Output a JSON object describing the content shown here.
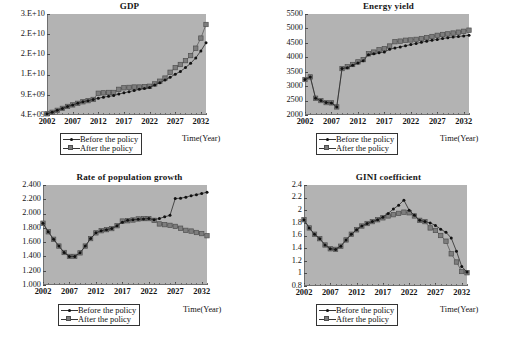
{
  "figure": {
    "background": "#ffffff",
    "plot_background": "#b3b3b3",
    "series_colors": {
      "before": "#2b2b2b",
      "after": "#6e6e6e"
    }
  },
  "legend": {
    "before_label": "Before the policy",
    "after_label": "After the policy",
    "before_marker": "dot-marker-icon",
    "after_marker": "square-marker-icon"
  },
  "axis": {
    "x_title": "Time(Year)",
    "x_ticks": [
      "2002",
      "2007",
      "2012",
      "2017",
      "2022",
      "2027",
      "2032"
    ]
  },
  "chart_data": [
    {
      "type": "line",
      "title": "GDP",
      "xlabel": "Time(Year)",
      "ylabel": "",
      "x": [
        2002,
        2003,
        2004,
        2005,
        2006,
        2007,
        2008,
        2009,
        2010,
        2011,
        2012,
        2013,
        2014,
        2015,
        2016,
        2017,
        2018,
        2019,
        2020,
        2021,
        2022,
        2023,
        2024,
        2025,
        2026,
        2027,
        2028,
        2029,
        2030,
        2031,
        2032,
        2033
      ],
      "ytick_labels": [
        "3.E+10",
        "2.E+10",
        "2.E+10",
        "1.E+10",
        "9.E+09",
        "4.E+09"
      ],
      "ylim": [
        4000000000.0,
        30000000000.0
      ],
      "grid": false,
      "legend_position": "below-left",
      "series": [
        {
          "name": "Before the policy",
          "values": [
            4300000000.0,
            4700000000.0,
            5200000000.0,
            5700000000.0,
            6200000000.0,
            6600000000.0,
            7000000000.0,
            7400000000.0,
            7700000000.0,
            8000000000.0,
            8300000000.0,
            8600000000.0,
            8800000000.0,
            9000000000.0,
            9400000000.0,
            9700000000.0,
            10000000000.0,
            10300000000.0,
            10600000000.0,
            10800000000.0,
            11100000000.0,
            11700000000.0,
            12300000000.0,
            13000000000.0,
            13700000000.0,
            14500000000.0,
            15200000000.0,
            16200000000.0,
            17300000000.0,
            18700000000.0,
            20500000000.0,
            22600000000.0
          ]
        },
        {
          "name": "After the policy",
          "values": [
            4300000000.0,
            4700000000.0,
            5200000000.0,
            5700000000.0,
            6200000000.0,
            6600000000.0,
            7000000000.0,
            7400000000.0,
            7700000000.0,
            8000000000.0,
            9600000000.0,
            9700000000.0,
            9800000000.0,
            9800000000.0,
            10600000000.0,
            11000000000.0,
            11100000000.0,
            11200000000.0,
            11200000000.0,
            11300000000.0,
            11400000000.0,
            12000000000.0,
            12700000000.0,
            13500000000.0,
            15000000000.0,
            16200000000.0,
            17000000000.0,
            18000000000.0,
            19300000000.0,
            21200000000.0,
            23800000000.0,
            27300000000.0
          ]
        }
      ]
    },
    {
      "type": "line",
      "title": "Energy yield",
      "xlabel": "Time(Year)",
      "ylabel": "",
      "x": [
        2002,
        2003,
        2004,
        2005,
        2006,
        2007,
        2008,
        2009,
        2010,
        2011,
        2012,
        2013,
        2014,
        2015,
        2016,
        2017,
        2018,
        2019,
        2020,
        2021,
        2022,
        2023,
        2024,
        2025,
        2026,
        2027,
        2028,
        2029,
        2030,
        2031,
        2032,
        2033
      ],
      "ytick_labels": [
        "5500",
        "5000",
        "4500",
        "4000",
        "3500",
        "3000",
        "2500",
        "2000"
      ],
      "ylim": [
        2000,
        5500
      ],
      "grid": false,
      "legend_position": "below-left",
      "series": [
        {
          "name": "Before the policy",
          "values": [
            3230,
            3320,
            2580,
            2500,
            2430,
            2420,
            2280,
            3610,
            3640,
            3720,
            3800,
            3880,
            4090,
            4120,
            4160,
            4180,
            4280,
            4320,
            4360,
            4400,
            4440,
            4480,
            4520,
            4560,
            4590,
            4620,
            4650,
            4680,
            4700,
            4720,
            4740,
            4760
          ]
        },
        {
          "name": "After the policy",
          "values": [
            3230,
            3320,
            2580,
            2500,
            2430,
            2420,
            2280,
            3610,
            3670,
            3750,
            3840,
            3920,
            4120,
            4180,
            4260,
            4300,
            4390,
            4540,
            4560,
            4590,
            4600,
            4620,
            4650,
            4680,
            4720,
            4760,
            4790,
            4810,
            4840,
            4870,
            4900,
            4940
          ]
        }
      ]
    },
    {
      "type": "line",
      "title": "Rate of population growth",
      "xlabel": "Time(Year)",
      "ylabel": "",
      "x": [
        2002,
        2003,
        2004,
        2005,
        2006,
        2007,
        2008,
        2009,
        2010,
        2011,
        2012,
        2013,
        2014,
        2015,
        2016,
        2017,
        2018,
        2019,
        2020,
        2021,
        2022,
        2023,
        2024,
        2025,
        2026,
        2027,
        2028,
        2029,
        2030,
        2031,
        2032,
        2033
      ],
      "ytick_labels": [
        "2.400",
        "2.200",
        "2.000",
        "1.800",
        "1.600",
        "1.400",
        "1.200",
        "1.000"
      ],
      "ylim": [
        1.0,
        2.4
      ],
      "grid": false,
      "legend_position": "below-left",
      "series": [
        {
          "name": "Before the policy",
          "values": [
            1.865,
            1.745,
            1.64,
            1.545,
            1.455,
            1.4,
            1.4,
            1.45,
            1.545,
            1.65,
            1.73,
            1.76,
            1.775,
            1.79,
            1.83,
            1.88,
            1.905,
            1.915,
            1.92,
            1.925,
            1.93,
            1.915,
            1.93,
            1.955,
            1.975,
            2.21,
            2.215,
            2.23,
            2.25,
            2.265,
            2.28,
            2.3
          ]
        },
        {
          "name": "After the policy",
          "values": [
            1.865,
            1.745,
            1.64,
            1.545,
            1.455,
            1.4,
            1.4,
            1.45,
            1.545,
            1.65,
            1.73,
            1.76,
            1.775,
            1.79,
            1.83,
            1.895,
            1.9,
            1.91,
            1.925,
            1.93,
            1.93,
            1.905,
            1.855,
            1.845,
            1.835,
            1.82,
            1.795,
            1.765,
            1.755,
            1.735,
            1.72,
            1.69
          ]
        }
      ]
    },
    {
      "type": "line",
      "title": "GINI coefficient",
      "xlabel": "Time(Year)",
      "ylabel": "",
      "x": [
        2002,
        2003,
        2004,
        2005,
        2006,
        2007,
        2008,
        2009,
        2010,
        2011,
        2012,
        2013,
        2014,
        2015,
        2016,
        2017,
        2018,
        2019,
        2020,
        2021,
        2022,
        2023,
        2024,
        2025,
        2026,
        2027,
        2028,
        2029,
        2030,
        2031,
        2032,
        2033
      ],
      "ytick_labels": [
        "2.4",
        "2.2",
        "2",
        "1.8",
        "1.6",
        "1.4",
        "1.2",
        "1",
        "0.8"
      ],
      "ylim": [
        0.8,
        2.4
      ],
      "grid": false,
      "legend_position": "below-left",
      "series": [
        {
          "name": "Before the policy",
          "values": [
            1.85,
            1.72,
            1.62,
            1.55,
            1.45,
            1.39,
            1.38,
            1.43,
            1.53,
            1.62,
            1.69,
            1.75,
            1.79,
            1.82,
            1.85,
            1.89,
            1.95,
            2.02,
            2.08,
            2.16,
            2.0,
            1.92,
            1.84,
            1.82,
            1.8,
            1.76,
            1.7,
            1.65,
            1.56,
            1.35,
            1.11,
            1.02
          ]
        },
        {
          "name": "After the policy",
          "values": [
            1.85,
            1.72,
            1.62,
            1.55,
            1.45,
            1.39,
            1.38,
            1.43,
            1.53,
            1.62,
            1.69,
            1.75,
            1.79,
            1.82,
            1.85,
            1.88,
            1.91,
            1.93,
            1.95,
            1.97,
            1.96,
            1.91,
            1.84,
            1.82,
            1.72,
            1.68,
            1.6,
            1.51,
            1.31,
            1.18,
            1.03,
            1.01
          ]
        }
      ]
    }
  ]
}
